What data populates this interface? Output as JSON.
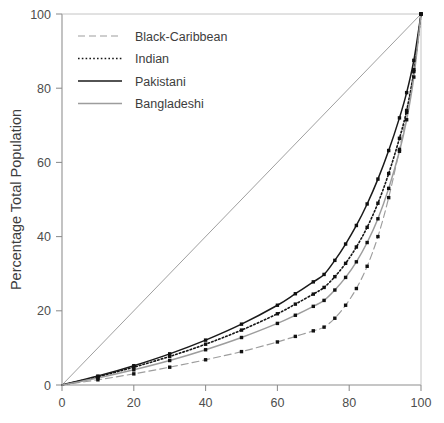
{
  "chart_data": {
    "type": "line",
    "title": "",
    "subtitle": "",
    "xlabel": "",
    "ylabel": "Percentage Total Population",
    "xlim": [
      0,
      100
    ],
    "ylim": [
      0,
      100
    ],
    "xticks": [
      0,
      20,
      40,
      60,
      80,
      100
    ],
    "yticks": [
      0,
      20,
      40,
      60,
      80,
      100
    ],
    "xticklabels": [
      "0",
      "20",
      "40",
      "60",
      "80",
      "100"
    ],
    "yticklabels": [
      "0",
      "20",
      "40",
      "60",
      "80",
      "100"
    ],
    "grid": false,
    "legend_position": "upper left",
    "annotations": [
      {
        "name": "line-of-equality",
        "description": "diagonal reference line from (0,0) to (100,100)",
        "x": [
          0,
          100
        ],
        "y": [
          0,
          100
        ],
        "style": "solid",
        "color": "#9a9a9a"
      }
    ],
    "series": [
      {
        "name": "Black-Caribbean",
        "style": "dashed",
        "color": "#9d9d9d",
        "marker": "square",
        "x": [
          0,
          10,
          20,
          30,
          40,
          50,
          60,
          65,
          70,
          73,
          76,
          79,
          82,
          85,
          88,
          91,
          94,
          96,
          98,
          100
        ],
        "y": [
          0,
          1.4,
          3.0,
          4.8,
          6.8,
          9.0,
          11.6,
          13.1,
          14.6,
          15.6,
          18.0,
          21.5,
          26.0,
          32.0,
          40.0,
          50.5,
          63.5,
          73.5,
          85.0,
          100
        ]
      },
      {
        "name": "Indian",
        "style": "dotted",
        "color": "#161616",
        "marker": "square",
        "x": [
          0,
          10,
          20,
          30,
          40,
          50,
          60,
          65,
          70,
          73,
          76,
          79,
          82,
          85,
          88,
          91,
          94,
          96,
          98,
          100
        ],
        "y": [
          0,
          2.2,
          4.8,
          7.7,
          11.0,
          14.8,
          19.2,
          21.8,
          24.5,
          26.3,
          29.2,
          32.8,
          37.2,
          42.5,
          49.0,
          57.0,
          66.5,
          74.0,
          84.5,
          100
        ]
      },
      {
        "name": "Pakistani",
        "style": "solid",
        "color": "#1a1a1a",
        "marker": "square",
        "x": [
          0,
          10,
          20,
          30,
          40,
          50,
          60,
          65,
          70,
          73,
          76,
          79,
          82,
          85,
          88,
          91,
          94,
          96,
          98,
          100
        ],
        "y": [
          0,
          2.4,
          5.2,
          8.4,
          12.1,
          16.4,
          21.5,
          24.6,
          27.8,
          29.8,
          33.6,
          38.0,
          43.0,
          48.8,
          55.5,
          63.2,
          72.0,
          78.8,
          87.5,
          100
        ]
      },
      {
        "name": "Bangladeshi",
        "style": "solid",
        "color": "#9d9d9d",
        "marker": "square",
        "x": [
          0,
          10,
          20,
          30,
          40,
          50,
          60,
          65,
          70,
          73,
          76,
          79,
          82,
          85,
          88,
          91,
          94,
          96,
          98,
          100
        ],
        "y": [
          0,
          1.9,
          4.1,
          6.6,
          9.5,
          12.8,
          16.6,
          18.8,
          21.2,
          22.8,
          25.6,
          29.0,
          33.2,
          38.4,
          44.8,
          53.0,
          63.0,
          71.5,
          83.0,
          100
        ]
      }
    ],
    "legend_entries": [
      {
        "label": "Black-Caribbean",
        "style": "dashed",
        "color": "#9d9d9d"
      },
      {
        "label": "Indian",
        "style": "dotted",
        "color": "#161616"
      },
      {
        "label": "Pakistani",
        "style": "solid",
        "color": "#1a1a1a"
      },
      {
        "label": "Bangladeshi",
        "style": "solid",
        "color": "#9d9d9d"
      }
    ]
  },
  "plot_geometry": {
    "left": 62,
    "right": 421,
    "top": 14,
    "bottom": 385
  }
}
